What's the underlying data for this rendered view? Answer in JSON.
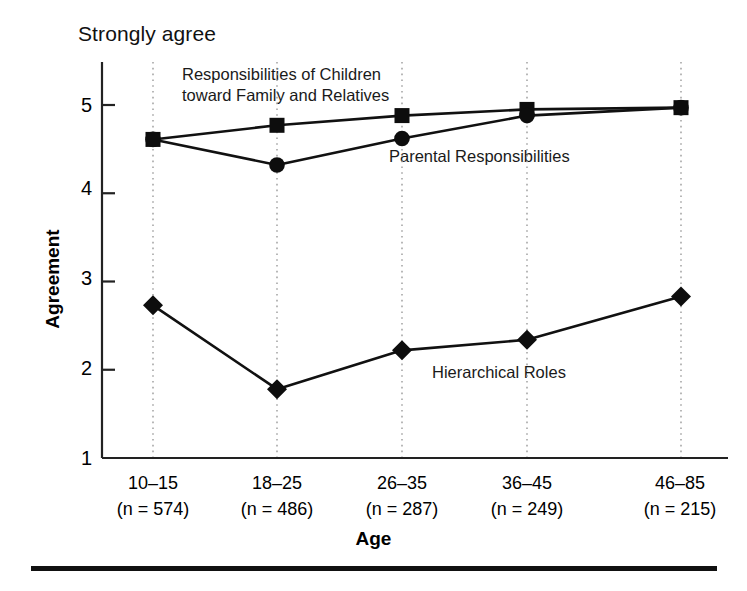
{
  "axis_top_note": "Strongly agree",
  "axes": {
    "ylabel": "Agreement",
    "xlabel": "Age",
    "y_ticks": [
      "5",
      "4",
      "3",
      "2",
      "1"
    ],
    "x_tick_labels": [
      {
        "range": "10–15",
        "n": "(n = 574)"
      },
      {
        "range": "18–25",
        "n": "(n = 486)"
      },
      {
        "range": "26–35",
        "n": "(n = 287)"
      },
      {
        "range": "36–45",
        "n": "(n = 249)"
      },
      {
        "range": "46–85",
        "n": "(n = 215)"
      }
    ]
  },
  "annotations": {
    "children_line1": "Responsibilities of Children",
    "children_line2": "toward Family and Relatives",
    "parental": "Parental Responsibilities",
    "hierarchical": "Hierarchical Roles"
  },
  "colors": {
    "line": "#111111",
    "marker": "#0d0d0d",
    "gridline": "#9a9a9a",
    "axis": "#222222",
    "rule": "#111111"
  },
  "chart_data": {
    "type": "line",
    "title": "",
    "subtitle": "",
    "xlabel": "Age",
    "ylabel": "Agreement",
    "ylim": [
      1,
      5.3
    ],
    "yticks": [
      1,
      2,
      3,
      4,
      5
    ],
    "grid": "vertical-dotted",
    "legend": "inline-annotations",
    "categories": [
      "10–15",
      "18–25",
      "26–35",
      "36–45",
      "46–85"
    ],
    "sample_sizes": [
      574,
      486,
      287,
      249,
      215
    ],
    "series": [
      {
        "name": "Responsibilities of Children toward Family and Relatives",
        "marker": "square",
        "values": [
          4.61,
          4.77,
          4.88,
          4.95,
          4.97
        ]
      },
      {
        "name": "Parental Responsibilities",
        "marker": "circle",
        "values": [
          4.61,
          4.32,
          4.62,
          4.88,
          4.97
        ]
      },
      {
        "name": "Hierarchical Roles",
        "marker": "diamond",
        "values": [
          2.73,
          1.78,
          2.22,
          2.34,
          2.83
        ]
      }
    ]
  }
}
